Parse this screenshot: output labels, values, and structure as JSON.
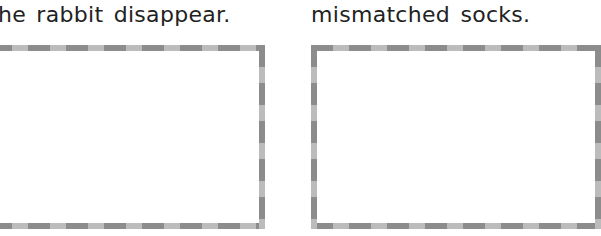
{
  "panels": [
    {
      "caption": "he rabbit disappear.",
      "drawing_box": {
        "content": ""
      }
    },
    {
      "caption": "mismatched socks.",
      "drawing_box": {
        "content": ""
      }
    }
  ],
  "colors": {
    "text": "#222222",
    "dash_dark": "#8c8c8c",
    "dash_light": "#bcbcbc",
    "background": "#ffffff"
  }
}
